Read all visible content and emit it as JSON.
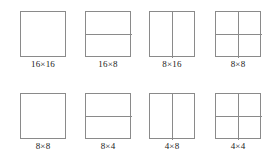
{
  "figure": {
    "stroke_color": "#8a8a8a",
    "background_color": "#ffffff",
    "label_color": "#1a1a1a"
  },
  "rows": [
    {
      "cells": [
        {
          "label": "16×16",
          "split": "none"
        },
        {
          "label": "16×8",
          "split": "horizontal"
        },
        {
          "label": "8×16",
          "split": "vertical"
        },
        {
          "label": "8×8",
          "split": "both"
        }
      ]
    },
    {
      "cells": [
        {
          "label": "8×8",
          "split": "none"
        },
        {
          "label": "8×4",
          "split": "horizontal"
        },
        {
          "label": "4×8",
          "split": "vertical"
        },
        {
          "label": "4×4",
          "split": "both"
        }
      ]
    }
  ]
}
